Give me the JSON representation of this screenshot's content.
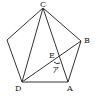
{
  "diagram": {
    "type": "geometry",
    "vertices": [
      {
        "id": "C",
        "label": "C"
      },
      {
        "id": "B",
        "label": "B"
      },
      {
        "id": "A",
        "label": "A"
      },
      {
        "id": "D",
        "label": "D"
      },
      {
        "id": "P",
        "label": ""
      }
    ],
    "intersection": {
      "id": "E",
      "label": "E"
    },
    "angle_label": "ア",
    "segments": [
      "C-B",
      "B-A",
      "A-D",
      "D-P",
      "P-C",
      "C-D",
      "C-A",
      "D-B"
    ]
  }
}
